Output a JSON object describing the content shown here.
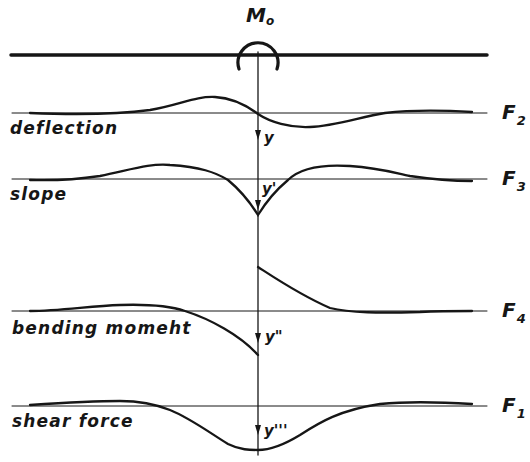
{
  "diagram": {
    "moment_label": {
      "symbol": "M",
      "subscript": "o"
    },
    "colors": {
      "ink": "#161616",
      "background": "#ffffff"
    },
    "rows": [
      {
        "name": "deflection",
        "label": "deflection",
        "axis_label": "y",
        "function_label": {
          "symbol": "F",
          "subscript": "2"
        }
      },
      {
        "name": "slope",
        "label": "slope",
        "axis_label": "y'",
        "function_label": {
          "symbol": "F",
          "subscript": "3"
        }
      },
      {
        "name": "bending-moment",
        "label": "bending momeht",
        "axis_label": "y\"",
        "function_label": {
          "symbol": "F",
          "subscript": "4"
        }
      },
      {
        "name": "shear-force",
        "label": "shear force",
        "axis_label": "y'''",
        "function_label": {
          "symbol": "F",
          "subscript": "1"
        }
      }
    ]
  }
}
